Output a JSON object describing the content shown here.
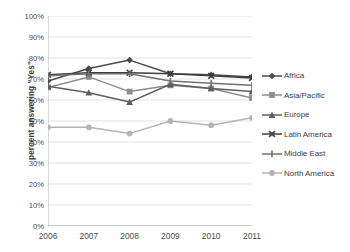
{
  "chart_data": {
    "type": "line",
    "title": "",
    "xlabel": "",
    "ylabel": "percent answering \"Yes\"",
    "categories": [
      "2006",
      "2007",
      "2008",
      "2009",
      "2010",
      "2011"
    ],
    "ylim": [
      0,
      100
    ],
    "yticks": [
      "0%",
      "10%",
      "20%",
      "30%",
      "40%",
      "50%",
      "60%",
      "70%",
      "80%",
      "90%",
      "100%"
    ],
    "ytick_values": [
      0,
      10,
      20,
      30,
      40,
      50,
      60,
      70,
      80,
      90,
      100
    ],
    "grid": "horizontal",
    "legend_position": "right",
    "series": [
      {
        "name": "Africa",
        "marker": "diamond",
        "color": "#4a4a4a",
        "values": [
          69,
          75,
          79,
          72.5,
          72,
          71
        ]
      },
      {
        "name": "Asia/Pacific",
        "marker": "square",
        "color": "#8d8d8d",
        "values": [
          66,
          71,
          64,
          67,
          65.5,
          61
        ]
      },
      {
        "name": "Europe",
        "marker": "triangle",
        "color": "#5e5e5e",
        "values": [
          66.5,
          63.5,
          59,
          67.5,
          65.5,
          64
        ]
      },
      {
        "name": "Latin America",
        "marker": "cross",
        "color": "#3c3c3c",
        "values": [
          72,
          73,
          73,
          72.5,
          71.5,
          70.5
        ]
      },
      {
        "name": "Middle East",
        "marker": "dash",
        "color": "#707070",
        "values": [
          71.5,
          72.5,
          72.5,
          69,
          68,
          67
        ]
      },
      {
        "name": "North America",
        "marker": "circle",
        "color": "#b4b4b4",
        "values": [
          47,
          47,
          44,
          50,
          48,
          51.5
        ]
      }
    ]
  }
}
